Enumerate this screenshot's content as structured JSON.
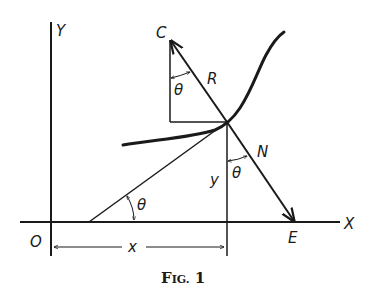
{
  "figure": {
    "caption_prefix": "F",
    "caption_smallcaps": "IG.",
    "caption_number": "1",
    "labels": {
      "y_axis": "Y",
      "x_axis": "X",
      "origin": "O",
      "center": "C",
      "radius": "R",
      "normal": "N",
      "normal_foot": "E",
      "ordinate": "y",
      "abscissa": "x",
      "angle_top": "θ",
      "angle_middle": "θ",
      "angle_bottom": "θ"
    },
    "colors": {
      "ink": "#1a1a1a",
      "background": "#ffffff"
    }
  }
}
